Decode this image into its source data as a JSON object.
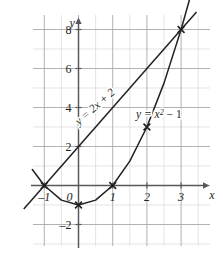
{
  "figure": {
    "name": "graph-of-line-and-parabola",
    "axes": {
      "x_axis_label": "x",
      "y_axis_label": "y",
      "x_ticks": [
        {
          "value": -1,
          "label": "–1"
        },
        {
          "value": 0,
          "label": "0"
        },
        {
          "value": 1,
          "label": "1"
        },
        {
          "value": 2,
          "label": "2"
        },
        {
          "value": 3,
          "label": "3"
        }
      ],
      "y_ticks": [
        {
          "value": -2,
          "label": "–2"
        },
        {
          "value": 2,
          "label": "2"
        },
        {
          "value": 4,
          "label": "4"
        },
        {
          "value": 6,
          "label": "6"
        },
        {
          "value": 8,
          "label": "8"
        }
      ],
      "xlim": [
        -1.65,
        3.85
      ],
      "ylim": [
        -3.0,
        9.4
      ],
      "grid": "minor half-unit light, major unit darker",
      "grid_color_minor": "#d8d8da",
      "grid_color_major": "#a9a9ad",
      "axis_color": "#58585b"
    }
  },
  "chart_data": {
    "type": "line",
    "title": "",
    "xlabel": "x",
    "ylabel": "y",
    "xlim": [
      -1.65,
      3.85
    ],
    "ylim": [
      -3.0,
      9.4
    ],
    "grid": true,
    "legend": "inline curve labels",
    "series": [
      {
        "name": "y = 2x + 2",
        "label": "y = 2x + 2",
        "equation": "y = 2x + 2",
        "kind": "line",
        "slope": 2,
        "intercept": 2,
        "color": "#231f20",
        "label_position": {
          "x": 0.55,
          "y": 3.9,
          "rotation": -41
        },
        "x": [
          -1.6,
          3.45
        ],
        "y": [
          -1.2,
          8.9
        ]
      },
      {
        "name": "y = x^2 - 1",
        "label": "y = x² − 1",
        "equation": "y = x² − 1",
        "kind": "parabola",
        "a": 1,
        "b": 0,
        "c": -1,
        "color": "#231f20",
        "label_position": {
          "x": 2.35,
          "y": 3.45,
          "rotation": 0
        },
        "x": [
          -1.35,
          -1.0,
          -0.5,
          0.0,
          0.5,
          1.0,
          1.5,
          2.0,
          2.5,
          3.0,
          3.25
        ],
        "y": [
          0.82,
          0.0,
          -0.75,
          -1.0,
          -0.75,
          0.0,
          1.25,
          3.0,
          5.25,
          8.0,
          9.56
        ]
      }
    ],
    "marked_points": [
      {
        "x": -1,
        "y": 0,
        "marker": "x",
        "note": "intersection"
      },
      {
        "x": 0,
        "y": -1,
        "marker": "x",
        "note": "vertex of parabola"
      },
      {
        "x": 1,
        "y": 0,
        "marker": "x",
        "note": "parabola root"
      },
      {
        "x": 2,
        "y": 3,
        "marker": "x",
        "note": "point on parabola"
      },
      {
        "x": 3,
        "y": 8,
        "marker": "x",
        "note": "intersection"
      }
    ]
  }
}
